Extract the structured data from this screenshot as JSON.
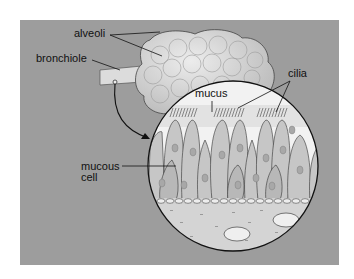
{
  "figure": {
    "colors": {
      "background": "#9d9d9d",
      "page": "#ffffff",
      "alveoli": "#d6d6d6",
      "cells": "#c4c4c4",
      "mucus": "#e8e8e8",
      "connective": "#d2d2d2",
      "outline": "#222222"
    },
    "labels": {
      "alveoli": "alveoli",
      "bronchiole": "bronchiole",
      "cilia": "cilia",
      "mucus": "mucus",
      "mucous_cell_line1": "mucous",
      "mucous_cell_line2": "cell"
    }
  }
}
